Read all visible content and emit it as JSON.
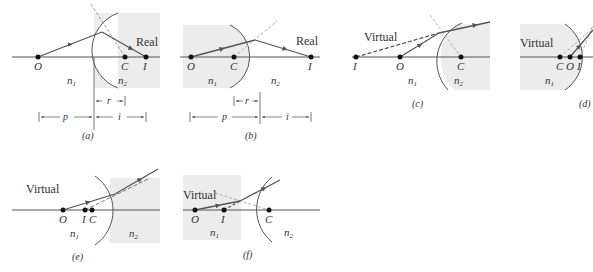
{
  "figure": {
    "colors": {
      "shade": "#ececec",
      "ray": "#555555",
      "axis": "#555555",
      "dashed": "#777777",
      "text": "#333333"
    }
  },
  "panels": [
    {
      "id": "a",
      "caption": "(a)",
      "image_type": "Real",
      "points": [
        "O",
        "C",
        "I"
      ],
      "media": [
        "n1",
        "n2"
      ],
      "dims": [
        "p",
        "r",
        "i"
      ]
    },
    {
      "id": "b",
      "caption": "(b)",
      "image_type": "Real",
      "points": [
        "O",
        "C",
        "I"
      ],
      "media": [
        "n1",
        "n2"
      ],
      "dims": [
        "p",
        "r",
        "i"
      ]
    },
    {
      "id": "c",
      "caption": "(c)",
      "image_type": "Virtual",
      "points": [
        "I",
        "O",
        "C"
      ],
      "media": [
        "n1",
        "n2"
      ]
    },
    {
      "id": "d",
      "caption": "(d)",
      "image_type": "Virtual",
      "points": [
        "C",
        "O",
        "I"
      ],
      "media": [
        "n1"
      ]
    },
    {
      "id": "e",
      "caption": "(e)",
      "image_type": "Virtual",
      "points": [
        "O",
        "I",
        "C"
      ],
      "media": [
        "n1",
        "n2"
      ]
    },
    {
      "id": "f",
      "caption": "(f)",
      "image_type": "Virtual",
      "points": [
        "O",
        "I",
        "C"
      ],
      "media": [
        "n1",
        "n2"
      ]
    }
  ],
  "labels": {
    "real": "Real",
    "virtual": "Virtual",
    "O": "O",
    "C": "C",
    "I": "I",
    "n1": "n",
    "n2": "n",
    "sub1": "1",
    "sub2": "2",
    "p": "p",
    "r": "r",
    "i": "i",
    "cap_a": "(a)",
    "cap_b": "(b)",
    "cap_c": "(c)",
    "cap_d": "(d)",
    "cap_e": "(e)",
    "cap_f": "(f)"
  }
}
